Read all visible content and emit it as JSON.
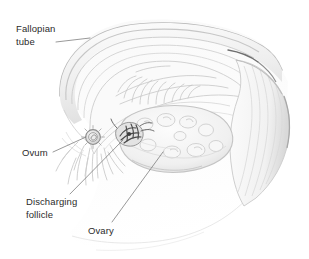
{
  "figure": {
    "type": "medical-illustration",
    "style": "grayscale pencil shaded anatomical drawing",
    "background_color": "#ffffff",
    "ink_color": "#9a9a9a",
    "dark_ink_color": "#555555",
    "label_text_color": "#2b2b2b",
    "leader_line_color": "#777777",
    "width": 309,
    "height": 259
  },
  "labels": [
    {
      "id": "fallopian-tube",
      "text": "Fallopian\ntube",
      "line_1": "Fallopian",
      "line_2": "tube"
    },
    {
      "id": "ovum",
      "text": "Ovum",
      "line_1": "Ovum",
      "line_2": ""
    },
    {
      "id": "discharging-follicle",
      "text": "Discharging\nfollicle",
      "line_1": "Discharging",
      "line_2": "follicle"
    },
    {
      "id": "ovary",
      "text": "Ovary",
      "line_1": "Ovary",
      "line_2": ""
    }
  ],
  "structures": [
    {
      "id": "fallopian-tube",
      "name": "Fallopian tube"
    },
    {
      "id": "ovum",
      "name": "Ovum"
    },
    {
      "id": "discharging-follicle",
      "name": "Discharging follicle"
    },
    {
      "id": "ovary",
      "name": "Ovary"
    },
    {
      "id": "fimbriae",
      "name": "Fimbriae"
    },
    {
      "id": "uterine-cavity",
      "name": "Uterine cavity with mucosal folds"
    },
    {
      "id": "broad-ligament",
      "name": "Broad ligament"
    }
  ]
}
